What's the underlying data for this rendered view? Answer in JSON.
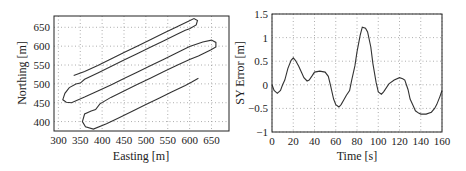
{
  "chart_data": [
    {
      "type": "line",
      "title": "",
      "xlabel": "Easting [m]",
      "ylabel": "Northing [m]",
      "xlim": [
        290,
        690
      ],
      "ylim": [
        375,
        680
      ],
      "xticks": [
        300,
        350,
        400,
        450,
        500,
        550,
        600,
        650
      ],
      "yticks": [
        400,
        450,
        500,
        550,
        600,
        650
      ],
      "grid": true,
      "series": [
        {
          "name": "trajectory",
          "x": [
            335,
            360,
            390,
            420,
            450,
            480,
            510,
            540,
            570,
            595,
            610,
            618,
            615,
            600,
            590,
            570,
            540,
            510,
            480,
            450,
            420,
            390,
            360,
            350,
            340,
            325,
            315,
            310,
            318,
            330,
            360,
            390,
            420,
            450,
            480,
            510,
            540,
            570,
            600,
            630,
            650,
            660,
            660,
            648,
            620,
            600,
            570,
            540,
            510,
            480,
            450,
            420,
            395,
            385,
            375,
            360,
            355,
            362,
            380,
            410,
            440,
            470,
            500,
            530,
            560,
            590,
            605,
            620
          ],
          "y": [
            522,
            533,
            549,
            566,
            583,
            600,
            617,
            634,
            651,
            665,
            673,
            668,
            656,
            646,
            642,
            631,
            614,
            597,
            580,
            563,
            546,
            529,
            512,
            502,
            500,
            490,
            475,
            458,
            451,
            450,
            465,
            481,
            497,
            514,
            531,
            548,
            565,
            582,
            599,
            611,
            616,
            610,
            598,
            590,
            574,
            565,
            549,
            532,
            515,
            498,
            481,
            464,
            447,
            432,
            428,
            420,
            400,
            386,
            380,
            394,
            411,
            428,
            445,
            462,
            479,
            496,
            505,
            515
          ]
        }
      ]
    },
    {
      "type": "line",
      "title": "",
      "xlabel": "Time [s]",
      "ylabel": "SY Error [m]",
      "xlim": [
        0,
        160
      ],
      "ylim": [
        -1,
        1.5
      ],
      "xticks": [
        0,
        20,
        40,
        60,
        80,
        100,
        120,
        140,
        160
      ],
      "yticks": [
        -1,
        -0.5,
        0,
        0.5,
        1,
        1.5
      ],
      "grid": true,
      "series": [
        {
          "name": "SY Error",
          "x": [
            0,
            2,
            5,
            8,
            10,
            12,
            15,
            18,
            20,
            22,
            25,
            28,
            30,
            33,
            35,
            38,
            40,
            45,
            50,
            53,
            55,
            58,
            60,
            63,
            65,
            68,
            70,
            73,
            75,
            78,
            80,
            83,
            85,
            88,
            90,
            93,
            95,
            98,
            100,
            103,
            105,
            110,
            115,
            120,
            123,
            125,
            128,
            130,
            133,
            135,
            138,
            140,
            145,
            150,
            153,
            155,
            158,
            160
          ],
          "y": [
            0.0,
            -0.12,
            -0.18,
            -0.12,
            0.0,
            0.1,
            0.35,
            0.52,
            0.57,
            0.52,
            0.4,
            0.25,
            0.15,
            0.08,
            0.1,
            0.2,
            0.27,
            0.29,
            0.27,
            0.18,
            0.0,
            -0.3,
            -0.42,
            -0.47,
            -0.42,
            -0.3,
            -0.22,
            -0.12,
            0.1,
            0.4,
            0.7,
            1.05,
            1.22,
            1.2,
            1.12,
            0.8,
            0.45,
            0.05,
            -0.15,
            -0.2,
            -0.15,
            0.02,
            0.1,
            0.15,
            0.13,
            0.1,
            -0.1,
            -0.3,
            -0.45,
            -0.55,
            -0.6,
            -0.62,
            -0.62,
            -0.58,
            -0.5,
            -0.42,
            -0.25,
            -0.12
          ]
        }
      ]
    }
  ],
  "left_chart": {
    "xlabel": "Easting [m]",
    "ylabel": "Northing [m]",
    "xticks": [
      "300",
      "350",
      "400",
      "450",
      "500",
      "550",
      "600",
      "650"
    ],
    "yticks": [
      "400",
      "450",
      "500",
      "550",
      "600",
      "650"
    ]
  },
  "right_chart": {
    "xlabel": "Time [s]",
    "ylabel": "SY Error [m]",
    "xticks": [
      "0",
      "20",
      "40",
      "60",
      "80",
      "100",
      "120",
      "140",
      "160"
    ],
    "yticks": [
      "−1",
      "−0.5",
      "0",
      "0.5",
      "1",
      "1.5"
    ]
  }
}
